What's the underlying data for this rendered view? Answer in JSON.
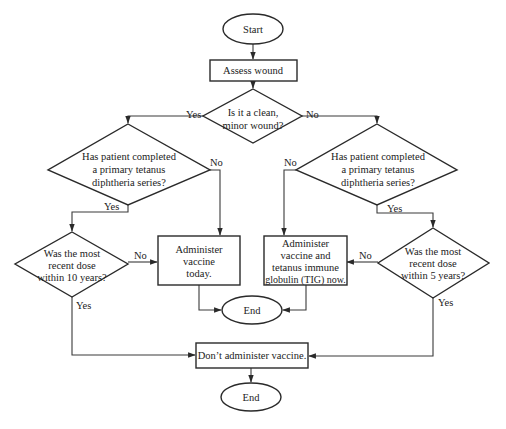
{
  "diagram": {
    "type": "flowchart",
    "title": "",
    "colors": {
      "stroke": "#2a2a2a",
      "fill": "#ffffff",
      "text": "#222222"
    },
    "nodes": {
      "start": {
        "shape": "ellipse",
        "lines": [
          "Start"
        ]
      },
      "assess": {
        "shape": "rect",
        "lines": [
          "Assess wound"
        ]
      },
      "clean": {
        "shape": "diamond",
        "lines": [
          "Is it a clean,",
          "minor wound?"
        ]
      },
      "series_left": {
        "shape": "diamond",
        "lines": [
          "Has patient completed",
          "a primary tetanus",
          "diphtheria series?"
        ]
      },
      "series_right": {
        "shape": "diamond",
        "lines": [
          "Has patient completed",
          "a primary tetanus",
          "diphtheria series?"
        ]
      },
      "recent10": {
        "shape": "diamond",
        "lines": [
          "Was the most",
          "recent dose",
          "within 10 years?"
        ]
      },
      "recent5": {
        "shape": "diamond",
        "lines": [
          "Was the most",
          "recent dose",
          "within 5 years?"
        ]
      },
      "vaccine_today": {
        "shape": "rect",
        "lines": [
          "Administer",
          "vaccine",
          "today."
        ]
      },
      "vaccine_tig": {
        "shape": "rect",
        "lines": [
          "Administer",
          "vaccine and",
          "tetanus immune",
          "globulin (TIG) now."
        ]
      },
      "end_mid": {
        "shape": "ellipse",
        "lines": [
          "End"
        ]
      },
      "dont": {
        "shape": "rect",
        "lines": [
          "Don’t administer vaccine."
        ]
      },
      "end_bottom": {
        "shape": "ellipse",
        "lines": [
          "End"
        ]
      }
    },
    "edges": [
      {
        "from": "start",
        "to": "assess",
        "label": ""
      },
      {
        "from": "assess",
        "to": "clean",
        "label": ""
      },
      {
        "from": "clean",
        "to": "series_left",
        "label": "Yes"
      },
      {
        "from": "clean",
        "to": "series_right",
        "label": "No"
      },
      {
        "from": "series_left",
        "to": "recent10",
        "label": "Yes"
      },
      {
        "from": "series_left",
        "to": "vaccine_today",
        "label": "No"
      },
      {
        "from": "series_right",
        "to": "vaccine_tig",
        "label": "No"
      },
      {
        "from": "series_right",
        "to": "recent5",
        "label": "Yes"
      },
      {
        "from": "recent10",
        "to": "vaccine_today",
        "label": "No"
      },
      {
        "from": "recent10",
        "to": "dont",
        "label": "Yes"
      },
      {
        "from": "recent5",
        "to": "vaccine_tig",
        "label": "No"
      },
      {
        "from": "recent5",
        "to": "dont",
        "label": "Yes"
      },
      {
        "from": "vaccine_today",
        "to": "end_mid",
        "label": ""
      },
      {
        "from": "vaccine_tig",
        "to": "end_mid",
        "label": ""
      },
      {
        "from": "dont",
        "to": "end_bottom",
        "label": ""
      }
    ],
    "edge_labels": {
      "clean_yes": "Yes",
      "clean_no": "No",
      "series_left_yes": "Yes",
      "series_left_no": "No",
      "series_right_no": "No",
      "series_right_yes": "Yes",
      "recent10_no": "No",
      "recent10_yes": "Yes",
      "recent5_no": "No",
      "recent5_yes": "Yes"
    }
  }
}
